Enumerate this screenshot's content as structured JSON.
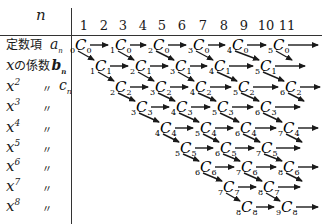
{
  "header": {
    "n_label": "n",
    "columns": [
      "1",
      "2",
      "3",
      "4",
      "5",
      "6",
      "7",
      "8",
      "9",
      "10",
      "11"
    ]
  },
  "rows": [
    {
      "label_main": "定数項",
      "var": "a",
      "var_sub": "n"
    },
    {
      "label_main": "xの係数",
      "var": "b",
      "var_sub": "n"
    },
    {
      "label_main": "x",
      "power": "2",
      "ditto": "〃",
      "var": "c",
      "var_sub": "n"
    },
    {
      "label_main": "x",
      "power": "3",
      "ditto": "〃"
    },
    {
      "label_main": "x",
      "power": "4",
      "ditto": "〃"
    },
    {
      "label_main": "x",
      "power": "5",
      "ditto": "〃"
    },
    {
      "label_main": "x",
      "power": "6",
      "ditto": "〃"
    },
    {
      "label_main": "x",
      "power": "7",
      "ditto": "〃"
    },
    {
      "label_main": "x",
      "power": "8",
      "ditto": "〃"
    }
  ],
  "nodes": [
    [
      {
        "pre": "0",
        "post": "0",
        "x": 80
      },
      {
        "pre": "1",
        "post": "0",
        "x": 120
      },
      {
        "pre": "2",
        "post": "0",
        "x": 158
      },
      {
        "pre": "3",
        "post": "0",
        "x": 198
      },
      {
        "pre": "4",
        "post": "0",
        "x": 237
      },
      {
        "pre": "5",
        "post": "0",
        "x": 278
      }
    ],
    [
      {
        "pre": "1",
        "post": "1",
        "x": 100
      },
      {
        "pre": "2",
        "post": "1",
        "x": 140
      },
      {
        "pre": "3",
        "post": "1",
        "x": 180
      },
      {
        "pre": "4",
        "post": "1",
        "x": 219
      },
      {
        "pre": "5",
        "post": "1",
        "x": 265
      }
    ],
    [
      {
        "pre": "2",
        "post": "2",
        "x": 120
      },
      {
        "pre": "3",
        "post": "2",
        "x": 160
      },
      {
        "pre": "4",
        "post": "2",
        "x": 200
      },
      {
        "pre": "5",
        "post": "2",
        "x": 243
      },
      {
        "pre": "6",
        "post": "2",
        "x": 290
      }
    ],
    [
      {
        "pre": "3",
        "post": "3",
        "x": 141
      },
      {
        "pre": "4",
        "post": "3",
        "x": 181
      },
      {
        "pre": "5",
        "post": "3",
        "x": 222
      },
      {
        "pre": "6",
        "post": "3",
        "x": 265
      }
    ],
    [
      {
        "pre": "4",
        "post": "4",
        "x": 165
      },
      {
        "pre": "5",
        "post": "4",
        "x": 205
      },
      {
        "pre": "6",
        "post": "4",
        "x": 245
      },
      {
        "pre": "7",
        "post": "4",
        "x": 288
      }
    ],
    [
      {
        "pre": "5",
        "post": "5",
        "x": 185
      },
      {
        "pre": "6",
        "post": "5",
        "x": 225
      },
      {
        "pre": "7",
        "post": "5",
        "x": 266
      }
    ],
    [
      {
        "pre": "6",
        "post": "6",
        "x": 205
      },
      {
        "pre": "7",
        "post": "6",
        "x": 246
      },
      {
        "pre": "8",
        "post": "6",
        "x": 288
      }
    ],
    [
      {
        "pre": "7",
        "post": "7",
        "x": 228
      },
      {
        "pre": "8",
        "post": "7",
        "x": 268
      }
    ],
    [
      {
        "pre": "8",
        "post": "8",
        "x": 246
      },
      {
        "pre": "9",
        "post": "8",
        "x": 286
      }
    ]
  ],
  "row_y": [
    45,
    66,
    87,
    107,
    128,
    148,
    167,
    187,
    207
  ],
  "trailing_arrow_end": [
    318,
    305,
    320,
    300,
    318,
    300,
    318,
    300,
    318
  ],
  "label_y": [
    45,
    66,
    87,
    107,
    128,
    148,
    167,
    187,
    207
  ],
  "column_x": [
    84,
    104,
    123,
    143,
    162,
    182,
    203,
    224,
    244,
    266,
    287
  ]
}
